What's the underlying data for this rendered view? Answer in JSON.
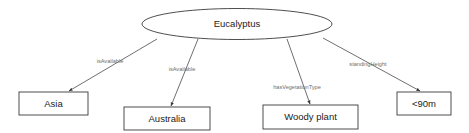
{
  "diagram": {
    "type": "node-link-graph",
    "background_color": "#ffffff",
    "root": {
      "id": "eucalyptus",
      "label": "Eucalyptus",
      "shape": "ellipse",
      "cx": 237,
      "cy": 24,
      "rx": 95,
      "ry": 15.5,
      "stroke_color": "#3a3a3a",
      "fill_color": "#ffffff"
    },
    "nodes": [
      {
        "id": "asia",
        "label": "Asia",
        "shape": "rect",
        "x": 19,
        "y": 92,
        "width": 69,
        "height": 23,
        "stroke_color": "#3a3a3a",
        "fill_color": "#ffffff"
      },
      {
        "id": "australia",
        "label": "Australia",
        "shape": "rect",
        "x": 124,
        "y": 107,
        "width": 86,
        "height": 23,
        "stroke_color": "#3a3a3a",
        "fill_color": "#ffffff"
      },
      {
        "id": "woody-plant",
        "label": "Woody plant",
        "shape": "rect",
        "x": 263,
        "y": 105,
        "width": 95,
        "height": 24,
        "stroke_color": "#3a3a3a",
        "fill_color": "#ffffff"
      },
      {
        "id": "under-90m",
        "label": "<90m",
        "shape": "rect",
        "x": 397,
        "y": 92,
        "width": 54,
        "height": 23,
        "stroke_color": "#3a3a3a",
        "fill_color": "#ffffff"
      }
    ],
    "edges": [
      {
        "id": "edge-asia",
        "source": "eucalyptus",
        "target": "asia",
        "label": "isAvailable",
        "label_x": 110,
        "label_y": 62,
        "x1": 157,
        "y1": 39,
        "x2": 69,
        "y2": 91,
        "stroke_color": "#4a4a4a",
        "arrowhead": true
      },
      {
        "id": "edge-australia",
        "source": "eucalyptus",
        "target": "australia",
        "label": "isAvailable",
        "label_x": 182,
        "label_y": 70,
        "x1": 198,
        "y1": 39,
        "x2": 171,
        "y2": 106,
        "stroke_color": "#4a4a4a",
        "arrowhead": true
      },
      {
        "id": "edge-woody-plant",
        "source": "eucalyptus",
        "target": "woody-plant",
        "label": "hasVegetationType",
        "label_x": 297,
        "label_y": 88,
        "x1": 287,
        "y1": 39,
        "x2": 310,
        "y2": 104,
        "stroke_color": "#4a4a4a",
        "arrowhead": true
      },
      {
        "id": "edge-under-90m",
        "source": "eucalyptus",
        "target": "under-90m",
        "label": "standingHeight",
        "label_x": 368,
        "label_y": 65,
        "x1": 323,
        "y1": 38,
        "x2": 420,
        "y2": 91,
        "stroke_color": "#4a4a4a",
        "arrowhead": true
      }
    ]
  }
}
